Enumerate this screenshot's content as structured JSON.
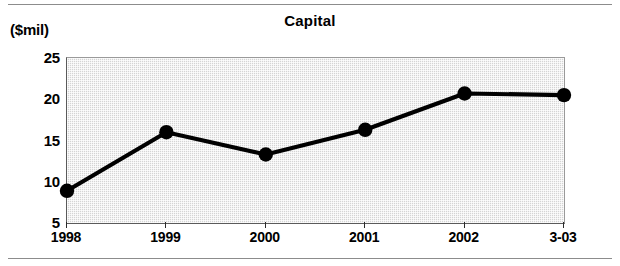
{
  "figure": {
    "unit_caption": "($mil)",
    "title": "Capital"
  },
  "chart_data": {
    "type": "line",
    "title": "Capital",
    "subtitle": "",
    "xlabel": "",
    "ylabel": "($mil)",
    "ylim": [
      5,
      25
    ],
    "yticks": [
      5,
      10,
      15,
      20,
      25
    ],
    "ytick_labels": [
      "5",
      "10",
      "15",
      "20",
      "25"
    ],
    "minor_yticks": [
      7.5,
      12.5,
      17.5,
      22.5
    ],
    "grid": false,
    "legend": "none",
    "plot_background": "#d4d4d4",
    "line_color": "#000000",
    "marker": "circle",
    "marker_color": "#000000",
    "categories": [
      "1998",
      "1999",
      "2000",
      "2001",
      "2002",
      "3-03"
    ],
    "values": [
      8.9,
      16.0,
      13.3,
      16.3,
      20.7,
      20.5
    ],
    "series": [
      {
        "name": "Capital",
        "values": [
          8.9,
          16.0,
          13.3,
          16.3,
          20.7,
          20.5
        ]
      }
    ]
  }
}
